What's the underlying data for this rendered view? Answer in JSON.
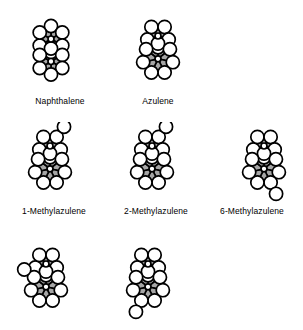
{
  "figure": {
    "background_color": "#ffffff",
    "ring_fill_color": "#a6a6a6",
    "atom_fill_color": "#ffffff",
    "stroke_color": "#000000",
    "label_color": "#000000"
  },
  "molecules": [
    {
      "id": "naphthalene",
      "label": "Naphthalene",
      "kind": "fused-6-6",
      "label_x": 21,
      "label_y": 96,
      "label_w": 78,
      "x": 20,
      "y": 12,
      "w": 62,
      "h": 82,
      "substituents": []
    },
    {
      "id": "azulene",
      "label": "Azulene",
      "kind": "fused-5-7",
      "label_x": 125,
      "label_y": 96,
      "label_w": 66,
      "x": 126,
      "y": 12,
      "w": 64,
      "h": 82,
      "substituents": []
    },
    {
      "id": "1-methylazulene",
      "label": "1-Methylazulene",
      "kind": "fused-5-7",
      "label_x": 4,
      "label_y": 206,
      "label_w": 100,
      "x": 18,
      "y": 122,
      "w": 64,
      "h": 82,
      "substituents": [
        "c1"
      ]
    },
    {
      "id": "2-methylazulene",
      "label": "2-Methylazulene",
      "kind": "fused-5-7",
      "label_x": 106,
      "label_y": 206,
      "label_w": 100,
      "x": 120,
      "y": 122,
      "w": 64,
      "h": 82,
      "substituents": [
        "c2"
      ]
    },
    {
      "id": "6-methylazulene",
      "label": "6-Methylazulene",
      "kind": "fused-5-7",
      "label_x": 202,
      "label_y": 206,
      "label_w": 100,
      "x": 232,
      "y": 122,
      "w": 64,
      "h": 82,
      "substituents": [
        "c6"
      ]
    },
    {
      "id": "methylazulene-bottom-left",
      "label": "",
      "kind": "fused-5-7",
      "label_x": 4,
      "label_y": 326,
      "label_w": 100,
      "x": 14,
      "y": 240,
      "w": 64,
      "h": 82,
      "substituents": [
        "c4"
      ]
    },
    {
      "id": "methylazulene-bottom-right",
      "label": "",
      "kind": "fused-5-7",
      "label_x": 106,
      "label_y": 326,
      "label_w": 100,
      "x": 116,
      "y": 240,
      "w": 64,
      "h": 82,
      "substituents": [
        "c5"
      ]
    }
  ]
}
